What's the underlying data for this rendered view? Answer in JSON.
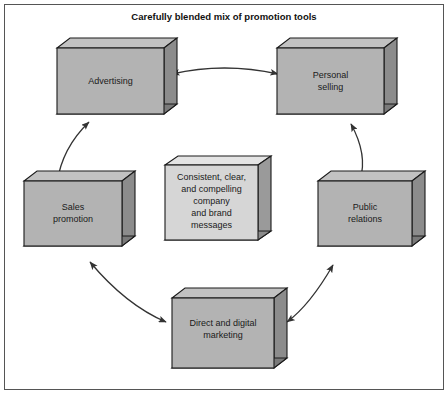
{
  "title": "Carefully blended mix of promotion tools",
  "frame": {
    "border_color": "#555555",
    "background": "#ffffff"
  },
  "style": {
    "box_fill": "#b3b3b3",
    "box_fill_center": "#d6d6d6",
    "box_side_fill": "#8c8c8c",
    "box_bottom_fill": "#7a7a7a",
    "box_stroke": "#1a1a1a",
    "arrow_color": "#333333",
    "title_color": "#111111"
  },
  "boxes": [
    {
      "id": "advertising",
      "name": "advertising-box",
      "lines": [
        "Advertising"
      ]
    },
    {
      "id": "personal-selling",
      "name": "personal-selling-box",
      "lines": [
        "Personal",
        "selling"
      ]
    },
    {
      "id": "public-relations",
      "name": "public-relations-box",
      "lines": [
        "Public",
        "relations"
      ]
    },
    {
      "id": "direct-and-digital-marketing",
      "name": "direct-and-digital-marketing-box",
      "lines": [
        "Direct and digital",
        "marketing"
      ]
    },
    {
      "id": "sales-promotion",
      "name": "sales-promotion-box",
      "lines": [
        "Sales",
        "promotion"
      ]
    }
  ],
  "center_box": {
    "id": "consistent-message",
    "name": "center-message-box",
    "lines": [
      "Consistent, clear,",
      "and compelling",
      "company",
      "and brand",
      "messages"
    ]
  },
  "arrows": [
    {
      "id": "advertising-personal-selling",
      "double_headed": true
    },
    {
      "id": "personal-selling-public-relations",
      "double_headed": true
    },
    {
      "id": "public-relations-direct-marketing",
      "double_headed": true
    },
    {
      "id": "direct-marketing-sales-promotion",
      "double_headed": true
    },
    {
      "id": "sales-promotion-advertising",
      "double_headed": true
    }
  ]
}
